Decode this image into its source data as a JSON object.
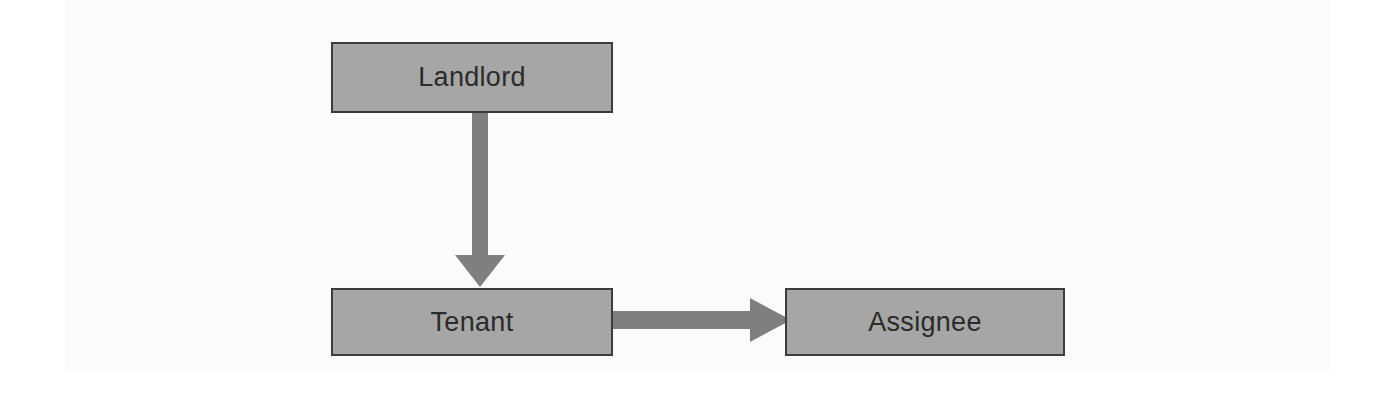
{
  "diagram": {
    "type": "flow-diagram",
    "title": "",
    "background_color": "#ffffff",
    "plate_color": "#fbfbfb",
    "node_fill_color": "#a6a6a6",
    "node_border_color": "#3c3c3c",
    "arrow_color": "#7f7f7f",
    "label_color": "#2b2b2b",
    "nodes": [
      {
        "id": "landlord",
        "label": "Landlord"
      },
      {
        "id": "tenant",
        "label": "Tenant"
      },
      {
        "id": "assignee",
        "label": "Assignee"
      }
    ],
    "edges": [
      {
        "id": "landlord-tenant",
        "from": "Landlord",
        "to": "Tenant",
        "direction": "down",
        "label": ""
      },
      {
        "id": "tenant-assignee",
        "from": "Tenant",
        "to": "Assignee",
        "direction": "right",
        "label": ""
      }
    ]
  }
}
